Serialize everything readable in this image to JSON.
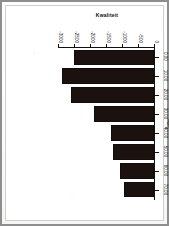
{
  "page": {
    "background_color": "#ffffff",
    "frame_color": "#8e8e8e",
    "inner_frame_color": "#cfcfcf"
  },
  "chart_data": {
    "type": "bar",
    "title": "",
    "orientation": "rotated-90-on-page",
    "bar_color": "#1b120f",
    "grid": false,
    "legend": false,
    "xlabel": "age",
    "ylabel": "Kwaliteit",
    "categories": [
      "0.00",
      "10.00",
      "20.00",
      "30.00",
      "40.00",
      "50.00",
      "60.00",
      "70.00"
    ],
    "values": [
      -2510,
      -2880,
      -2600,
      -1860,
      -1330,
      -1270,
      -1050,
      -930
    ],
    "ylim": [
      -3000,
      0
    ],
    "yticks": [
      0,
      -500,
      -1000,
      -1500,
      -2000,
      -2500,
      -3000
    ],
    "ytick_labels": [
      "0",
      "-500",
      "-1000",
      "-1500",
      "-2000",
      "-2500",
      "-3000"
    ],
    "xtick_labels": [
      "0.00",
      "10.00",
      "20.00",
      "30.00",
      "40.00",
      "50.00",
      "60.00",
      "70.00"
    ]
  }
}
